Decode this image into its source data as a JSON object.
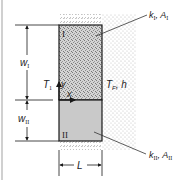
{
  "figure": {
    "type": "composite-fin-schematic",
    "colors": {
      "outline": "#1a1a1a",
      "region_I_fill": "#cfcfcf",
      "region_II_fill": "#c8c8c8",
      "fluid_dots": "#bdbdbd",
      "insulation": "#9a9a9a",
      "left_border": "#b8b8b8"
    }
  },
  "labels": {
    "region_I": "I",
    "region_II": "II",
    "material_I": {
      "k": "k",
      "k_sub": "I",
      "sep": ", ",
      "A": "A",
      "A_sub": "I"
    },
    "material_II": {
      "k": "k",
      "k_sub": "II",
      "sep": ", ",
      "A": "A",
      "A_sub": "II"
    },
    "fluid": {
      "T": "T",
      "T_sub": "F",
      "sep": ", ",
      "h": "h"
    },
    "base_temp": {
      "T": "T",
      "T_sub": "1"
    },
    "axis_y": "y",
    "axis_x": "x",
    "width_I": {
      "w": "w",
      "sub": "I"
    },
    "width_II": {
      "w": "w",
      "sub": "II"
    },
    "length": "L"
  }
}
